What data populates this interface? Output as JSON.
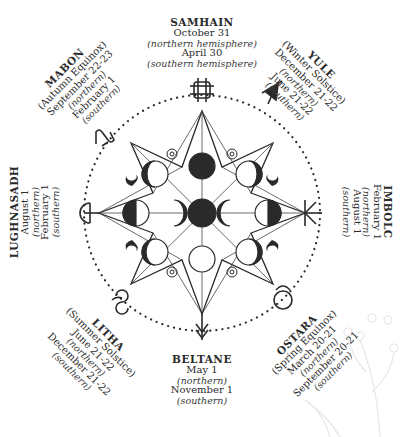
{
  "diagram": {
    "colors": {
      "ink": "#2a2a2a",
      "background": "#ffffff",
      "foliage": "#e8e8e8"
    },
    "center": {
      "x": 202,
      "y": 213
    },
    "moon_phases": [
      "full-moon",
      "waxing-gibbous",
      "first-quarter",
      "waxing-crescent",
      "new-moon",
      "waning-crescent",
      "last-quarter",
      "waning-gibbous"
    ],
    "sabbats": [
      {
        "id": "samhain",
        "name": "SAMHAIN",
        "subtitle": "",
        "north_date": "October 31",
        "north_label": "(northern hemisphere)",
        "south_date": "April 30",
        "south_label": "(southern hemisphere)",
        "symbol": "samhain-knot-icon",
        "position": "top"
      },
      {
        "id": "yule",
        "name": "YULE",
        "subtitle": "(Winter Solstice)",
        "north_date": "December 21-22",
        "north_label": "(northern)",
        "south_date": "June 21-22",
        "south_label": "(southern)",
        "symbol": "yule-grapes-icon",
        "position": "top-right"
      },
      {
        "id": "imbolc",
        "name": "IMBOLC",
        "subtitle": "",
        "north_date": "February 1",
        "north_label": "(northern)",
        "south_date": "August 1",
        "south_label": "(southern)",
        "symbol": "imbolc-rune-icon",
        "position": "right"
      },
      {
        "id": "ostara",
        "name": "OSTARA",
        "subtitle": "(Spring Equinox)",
        "north_date": "March 20-21",
        "north_label": "(northern)",
        "south_date": "September 20-21",
        "south_label": "(southern)",
        "symbol": "ostara-taurus-icon",
        "position": "bottom-right"
      },
      {
        "id": "beltane",
        "name": "BELTANE",
        "subtitle": "",
        "north_date": "May 1",
        "north_label": "(northern)",
        "south_date": "November 1",
        "south_label": "(southern)",
        "symbol": "beltane-arrow-icon",
        "position": "bottom"
      },
      {
        "id": "litha",
        "name": "LITHA",
        "subtitle": "(Summer Solstice)",
        "north_date": "June 21-22",
        "north_label": "(northern)",
        "south_date": "December 21-22",
        "south_label": "(southern)",
        "symbol": "litha-gemini-icon",
        "position": "bottom-left"
      },
      {
        "id": "lughnasadh",
        "name": "LUGHNASADH",
        "subtitle": "",
        "north_date": "August 1",
        "north_label": "(northern)",
        "south_date": "February 1",
        "south_label": "(southern)",
        "symbol": "lughnasadh-sickle-icon",
        "position": "left"
      },
      {
        "id": "mabon",
        "name": "MABON",
        "subtitle": "(Autumn Equinox)",
        "north_date": "September 22-23",
        "north_label": "(northern)",
        "south_date": "February 1",
        "south_label": "(southern)",
        "symbol": "mabon-virgo-icon",
        "position": "top-left"
      }
    ]
  }
}
